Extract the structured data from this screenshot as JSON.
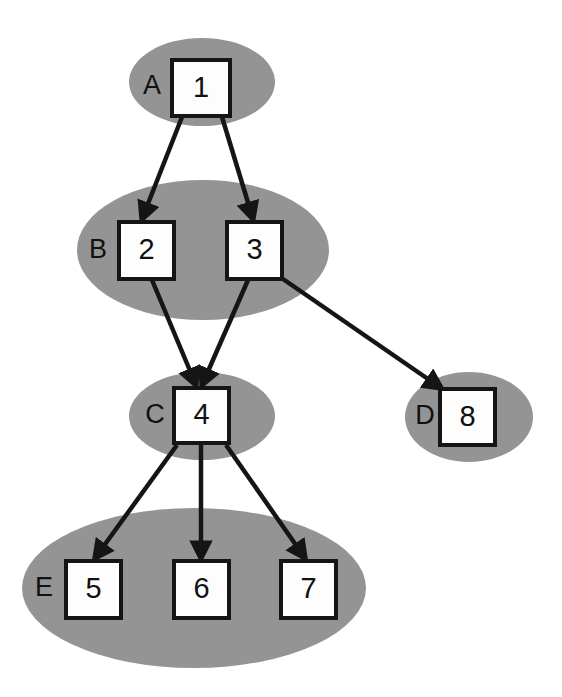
{
  "diagram": {
    "background_color": "#ffffff",
    "group_fill_color": "#949494",
    "node_fill_color": "#fdfdfd",
    "stroke_color": "#151515",
    "groups": [
      {
        "id": "A",
        "label": "A",
        "label_x": 152,
        "label_y": 87,
        "cx": 202,
        "cy": 82,
        "rx": 73,
        "ry": 44
      },
      {
        "id": "B",
        "label": "B",
        "label_x": 98,
        "label_y": 251,
        "cx": 203,
        "cy": 250,
        "rx": 126,
        "ry": 70
      },
      {
        "id": "C",
        "label": "C",
        "label_x": 155,
        "label_y": 416,
        "cx": 202,
        "cy": 416,
        "rx": 73,
        "ry": 44
      },
      {
        "id": "D",
        "label": "D",
        "label_x": 425,
        "label_y": 417,
        "cx": 469,
        "cy": 417,
        "rx": 64,
        "ry": 45
      },
      {
        "id": "E",
        "label": "E",
        "label_x": 44,
        "label_y": 589,
        "cx": 194,
        "cy": 588,
        "rx": 172,
        "ry": 80
      }
    ],
    "nodes": [
      {
        "id": "1",
        "label": "1",
        "group": "A",
        "x": 172,
        "y": 60,
        "w": 58,
        "h": 56
      },
      {
        "id": "2",
        "label": "2",
        "group": "B",
        "x": 119,
        "y": 222,
        "w": 55,
        "h": 57
      },
      {
        "id": "3",
        "label": "3",
        "group": "B",
        "x": 227,
        "y": 222,
        "w": 55,
        "h": 57
      },
      {
        "id": "4",
        "label": "4",
        "group": "C",
        "x": 174,
        "y": 388,
        "w": 55,
        "h": 55
      },
      {
        "id": "8",
        "label": "8",
        "group": "D",
        "x": 440,
        "y": 389,
        "w": 55,
        "h": 56
      },
      {
        "id": "5",
        "label": "5",
        "group": "E",
        "x": 66,
        "y": 561,
        "w": 55,
        "h": 57
      },
      {
        "id": "6",
        "label": "6",
        "group": "E",
        "x": 174,
        "y": 561,
        "w": 55,
        "h": 57
      },
      {
        "id": "7",
        "label": "7",
        "group": "E",
        "x": 281,
        "y": 561,
        "w": 55,
        "h": 57
      }
    ],
    "edges": [
      {
        "id": "edge-1-2",
        "from": "1",
        "to": "2",
        "x1": 182,
        "y1": 117,
        "x2": 142,
        "y2": 219,
        "arrowhead": true
      },
      {
        "id": "edge-1-3",
        "from": "1",
        "to": "3",
        "x1": 222,
        "y1": 117,
        "x2": 253,
        "y2": 219,
        "arrowhead": true
      },
      {
        "id": "edge-2-4",
        "from": "2",
        "to": "4",
        "x1": 152,
        "y1": 280,
        "x2": 196,
        "y2": 385,
        "arrowhead": true
      },
      {
        "id": "edge-3-4",
        "from": "3",
        "to": "4",
        "x1": 248,
        "y1": 280,
        "x2": 202,
        "y2": 385,
        "arrowhead": true
      },
      {
        "id": "edge-3-8",
        "from": "3",
        "to": "8",
        "x1": 283,
        "y1": 279,
        "x2": 441,
        "y2": 388,
        "arrowhead": true
      },
      {
        "id": "edge-4-5",
        "from": "4",
        "to": "5",
        "x1": 177,
        "y1": 445,
        "x2": 95,
        "y2": 558,
        "arrowhead": true
      },
      {
        "id": "edge-4-6",
        "from": "4",
        "to": "6",
        "x1": 201,
        "y1": 445,
        "x2": 201,
        "y2": 558,
        "arrowhead": true
      },
      {
        "id": "edge-4-7",
        "from": "4",
        "to": "7",
        "x1": 226,
        "y1": 445,
        "x2": 305,
        "y2": 558,
        "arrowhead": true
      }
    ]
  }
}
